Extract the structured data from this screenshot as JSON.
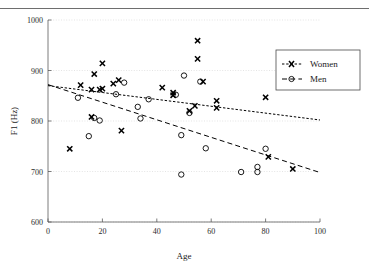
{
  "figure": {
    "clipped_header_text": "",
    "xlabel": "Age",
    "ylabel": "F1 (Hz)",
    "legend": {
      "women_label": "Women",
      "men_label": "Men"
    }
  },
  "axes": {
    "x_ticks": [
      "0",
      "20",
      "40",
      "60",
      "80",
      "100"
    ],
    "y_ticks": [
      "1000",
      "900",
      "800",
      "700",
      "600"
    ]
  },
  "chart_data": {
    "type": "scatter",
    "title": "",
    "xlabel": "Age",
    "ylabel": "F1 (Hz)",
    "xlim": [
      0,
      100
    ],
    "ylim": [
      600,
      1000
    ],
    "xticks": [
      0,
      20,
      40,
      60,
      80,
      100
    ],
    "yticks": [
      600,
      700,
      800,
      900,
      1000
    ],
    "grid": "horizontal-dotted",
    "legend_position": "upper-right-outside-plot",
    "series": [
      {
        "name": "Women",
        "marker": "x-bold",
        "points": [
          [
            8,
            745
          ],
          [
            12,
            871
          ],
          [
            16,
            862
          ],
          [
            16,
            808
          ],
          [
            19,
            862
          ],
          [
            20,
            864
          ],
          [
            20,
            914
          ],
          [
            17,
            893
          ],
          [
            24,
            874
          ],
          [
            26,
            881
          ],
          [
            27,
            781
          ],
          [
            42,
            866
          ],
          [
            46,
            851
          ],
          [
            46,
            856
          ],
          [
            52,
            820
          ],
          [
            54,
            830
          ],
          [
            55,
            959
          ],
          [
            55,
            923
          ],
          [
            57,
            878
          ],
          [
            62,
            840
          ],
          [
            62,
            826
          ],
          [
            80,
            847
          ],
          [
            81,
            729
          ],
          [
            90,
            705
          ]
        ],
        "trend": {
          "style": "dotted",
          "x0": 0,
          "y0": 870,
          "x1": 100,
          "y1": 802
        }
      },
      {
        "name": "Men",
        "marker": "open-circle",
        "points": [
          [
            11,
            846
          ],
          [
            15,
            770
          ],
          [
            17,
            806
          ],
          [
            19,
            801
          ],
          [
            25,
            853
          ],
          [
            28,
            876
          ],
          [
            33,
            828
          ],
          [
            34,
            805
          ],
          [
            37,
            843
          ],
          [
            47,
            852
          ],
          [
            49,
            772
          ],
          [
            49,
            694
          ],
          [
            50,
            890
          ],
          [
            52,
            816
          ],
          [
            56,
            878
          ],
          [
            58,
            746
          ],
          [
            71,
            699
          ],
          [
            77,
            709
          ],
          [
            77,
            699
          ],
          [
            80,
            745
          ]
        ],
        "trend": {
          "style": "dashed",
          "x0": 0,
          "y0": 872,
          "x1": 100,
          "y1": 698
        }
      }
    ]
  }
}
